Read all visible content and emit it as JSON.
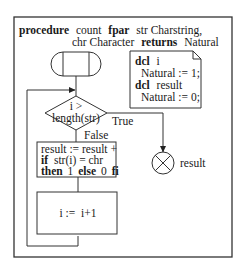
{
  "header": {
    "kw_procedure": "procedure",
    "name": "count",
    "kw_fpar": "fpar",
    "param1": "str Charstring,",
    "param2": "chr Character",
    "kw_returns": "returns",
    "return_type": "Natural"
  },
  "declarations": {
    "kw_dcl_1": "dcl",
    "var1": "i",
    "var1_init": "Natural := 1;",
    "kw_dcl_2": "dcl",
    "var2": "result",
    "var2_init": "Natural := 0;"
  },
  "decision": {
    "line1": "i >",
    "line2": "length(str)",
    "true_label": "True",
    "false_label": "False"
  },
  "task1": {
    "line1": "result := result +",
    "kw_if": "if",
    "cond": "str(i) = chr",
    "kw_then": "then",
    "then_val": "1",
    "kw_else": "else",
    "else_val": "0",
    "kw_fi": "fi"
  },
  "task2": {
    "text": "i :=  i+1"
  },
  "return": {
    "label": "result"
  }
}
